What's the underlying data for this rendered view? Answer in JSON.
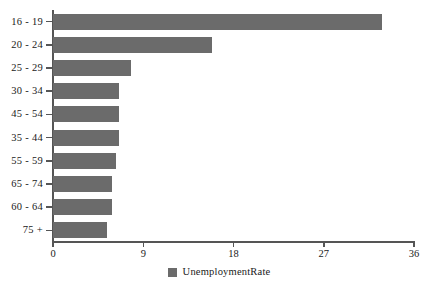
{
  "chart_data": {
    "type": "bar",
    "orientation": "horizontal",
    "title": "",
    "xlabel": "",
    "ylabel": "",
    "categories": [
      "16 - 19",
      "20 - 24",
      "25 - 29",
      "30 - 34",
      "45 - 54",
      "35 - 44",
      "55 - 59",
      "65 - 74",
      "60 - 64",
      "75 +"
    ],
    "values": [
      32.8,
      15.9,
      7.8,
      6.6,
      6.6,
      6.6,
      6.3,
      5.9,
      5.9,
      5.4
    ],
    "series": [
      {
        "name": "UnemploymentRate",
        "color": "#6b6b6b",
        "values": [
          32.8,
          15.9,
          7.8,
          6.6,
          6.6,
          6.6,
          6.3,
          5.9,
          5.9,
          5.4
        ]
      }
    ],
    "xlim": [
      0,
      36
    ],
    "xticks": [
      0,
      9,
      18,
      27,
      36
    ],
    "xtick_labels": [
      "0",
      "9",
      "18",
      "27",
      "36"
    ],
    "grid": false,
    "legend": {
      "position": "bottom-center",
      "entries": [
        {
          "label": "UnemploymentRate",
          "color": "#6b6b6b"
        }
      ]
    },
    "axis_color": "#555555",
    "background": "#ffffff"
  }
}
